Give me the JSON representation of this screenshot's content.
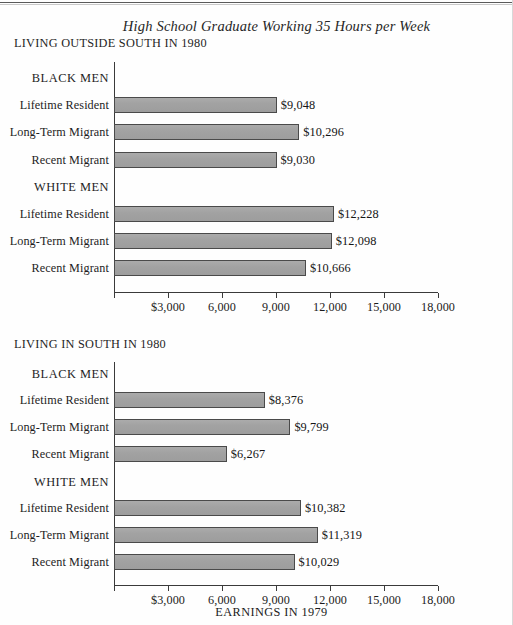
{
  "figure": {
    "title": "High School Graduate Working 35 Hours per Week",
    "axis_caption": "EARNINGS IN 1979",
    "bar_color": "#a3a3a3",
    "bar_edge_color": "#4a4a4a",
    "background": "#fefefe"
  },
  "panels": [
    {
      "title": "LIVING OUTSIDE SOUTH IN 1980"
    },
    {
      "title": "LIVING IN SOUTH IN 1980"
    }
  ],
  "axis": {
    "tick_labels": [
      "$3,000",
      "6,000",
      "9,000",
      "12,000",
      "15,000",
      "18,000"
    ],
    "tick_values": [
      3000,
      6000,
      9000,
      12000,
      15000,
      18000
    ],
    "min": 0,
    "max": 18000
  },
  "groups": {
    "black_men": "BLACK MEN",
    "white_men": "WHITE MEN"
  },
  "categories": [
    "Lifetime Resident",
    "Long-Term Migrant",
    "Recent Migrant"
  ],
  "chart_data": {
    "type": "bar",
    "title": "High School Graduate Working 35 Hours per Week",
    "xlabel": "EARNINGS IN 1979",
    "ylabel": "",
    "orientation": "horizontal",
    "xlim": [
      0,
      18000
    ],
    "xticks": [
      3000,
      6000,
      9000,
      12000,
      15000,
      18000
    ],
    "xticklabels": [
      "$3,000",
      "6,000",
      "9,000",
      "12,000",
      "15,000",
      "18,000"
    ],
    "grid": false,
    "legend": "none",
    "panels": [
      {
        "title": "LIVING OUTSIDE SOUTH IN 1980",
        "groups": [
          {
            "name": "BLACK MEN",
            "categories": [
              "Lifetime Resident",
              "Long-Term Migrant",
              "Recent Migrant"
            ],
            "values": [
              9048,
              10296,
              9030
            ],
            "labels": [
              "$9,048",
              "$10,296",
              "$9,030"
            ]
          },
          {
            "name": "WHITE MEN",
            "categories": [
              "Lifetime Resident",
              "Long-Term Migrant",
              "Recent Migrant"
            ],
            "values": [
              12228,
              12098,
              10666
            ],
            "labels": [
              "$12,228",
              "$12,098",
              "$10,666"
            ]
          }
        ]
      },
      {
        "title": "LIVING IN SOUTH IN 1980",
        "groups": [
          {
            "name": "BLACK MEN",
            "categories": [
              "Lifetime Resident",
              "Long-Term Migrant",
              "Recent Migrant"
            ],
            "values": [
              8376,
              9799,
              6267
            ],
            "labels": [
              "$8,376",
              "$9,799",
              "$6,267"
            ]
          },
          {
            "name": "WHITE MEN",
            "categories": [
              "Lifetime Resident",
              "Long-Term Migrant",
              "Recent Migrant"
            ],
            "values": [
              10382,
              11319,
              10029
            ],
            "labels": [
              "$10,382",
              "$11,319",
              "$10,029"
            ]
          }
        ]
      }
    ]
  }
}
